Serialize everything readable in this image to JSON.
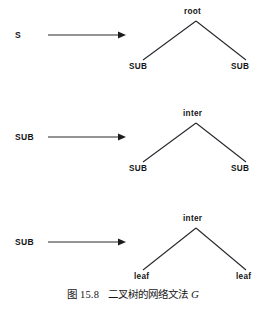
{
  "figure": {
    "caption_prefix": "图",
    "caption_number": "15.8",
    "caption_text": "二叉树的网络文法",
    "caption_symbol": "G",
    "background_color": "#ffffff",
    "ink_color": "#141414",
    "rules": [
      {
        "id": "rule-1",
        "lhs": "S",
        "arrow": "→",
        "tree": {
          "root_label": "root",
          "left_child_label": "SUB",
          "right_child_label": "SUB"
        }
      },
      {
        "id": "rule-2",
        "lhs": "SUB",
        "arrow": "→",
        "tree": {
          "root_label": "inter",
          "left_child_label": "SUB",
          "right_child_label": "SUB"
        }
      },
      {
        "id": "rule-3",
        "lhs": "SUB",
        "arrow": "→",
        "tree": {
          "root_label": "inter",
          "left_child_label": "leaf",
          "right_child_label": "leaf"
        }
      }
    ]
  }
}
